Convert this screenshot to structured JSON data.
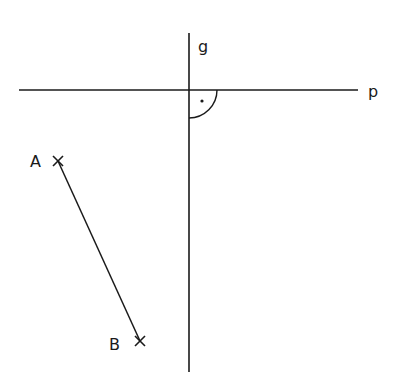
{
  "diagram": {
    "stroke_color": "#1a1a1a",
    "background": "#ffffff",
    "lines": {
      "g": {
        "label": "g",
        "x1": 189,
        "y1": 33,
        "x2": 189,
        "y2": 372,
        "label_x": 198,
        "label_y": 52
      },
      "p": {
        "label": "p",
        "x1": 19,
        "y1": 90,
        "x2": 358,
        "y2": 90,
        "label_x": 368,
        "label_y": 97
      }
    },
    "right_angle": {
      "cx": 189,
      "cy": 90,
      "r": 28,
      "dot_x": 202,
      "dot_y": 101
    },
    "segment_AB": {
      "A": {
        "label": "A",
        "x": 58,
        "y": 161,
        "label_x": 30,
        "label_y": 167
      },
      "B": {
        "label": "B",
        "x": 140,
        "y": 341,
        "label_x": 109,
        "label_y": 350
      }
    }
  }
}
